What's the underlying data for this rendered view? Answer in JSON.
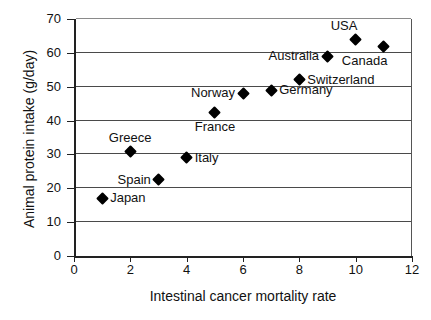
{
  "chart_data": {
    "type": "scatter",
    "title": "",
    "xlabel": "Intestinal cancer mortality rate",
    "ylabel": "Animal protein intake (g/day)",
    "xlim": [
      0,
      12
    ],
    "ylim": [
      0,
      70
    ],
    "xticks": [
      "0",
      "2",
      "4",
      "6",
      "8",
      "10",
      "12"
    ],
    "yticks": [
      "0",
      "10",
      "20",
      "30",
      "40",
      "50",
      "60",
      "70"
    ],
    "grid": "horizontal",
    "legend": "none",
    "marker": "diamond",
    "marker_color": "#000000",
    "points": [
      {
        "label": "Japan",
        "x": 1,
        "y": 17,
        "label_pos": "right"
      },
      {
        "label": "Greece",
        "x": 2,
        "y": 31,
        "label_pos": "above"
      },
      {
        "label": "Spain",
        "x": 3,
        "y": 22.5,
        "label_pos": "left"
      },
      {
        "label": "Italy",
        "x": 4,
        "y": 29,
        "label_pos": "right"
      },
      {
        "label": "France",
        "x": 5,
        "y": 42.5,
        "label_pos": "below"
      },
      {
        "label": "Norway",
        "x": 6,
        "y": 48,
        "label_pos": "left"
      },
      {
        "label": "Germany",
        "x": 7,
        "y": 49,
        "label_pos": "right"
      },
      {
        "label": "Switzerland",
        "x": 8,
        "y": 52,
        "label_pos": "right"
      },
      {
        "label": "Australia",
        "x": 9,
        "y": 59,
        "label_pos": "left"
      },
      {
        "label": "USA",
        "x": 10,
        "y": 64,
        "label_pos": "above-left"
      },
      {
        "label": "Canada",
        "x": 11,
        "y": 62,
        "label_pos": "below-left"
      }
    ]
  }
}
